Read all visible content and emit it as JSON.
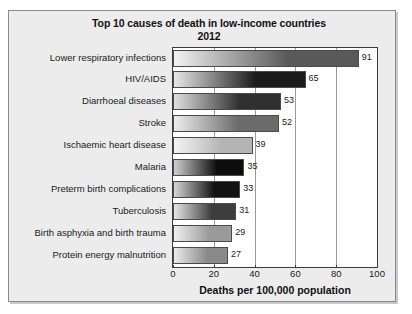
{
  "chart_data": {
    "type": "bar",
    "orientation": "horizontal",
    "title": "Top 10 causes of death in low-income countries",
    "subtitle": "2012",
    "xlabel": "Deaths per 100,000 population",
    "ylabel": "",
    "xlim": [
      0,
      100
    ],
    "xticks": [
      0,
      20,
      40,
      60,
      80,
      100
    ],
    "xtick_labels": [
      "0",
      "20",
      "40",
      "60",
      "80",
      "100"
    ],
    "grid": "vertical",
    "legend": "none",
    "categories": [
      "Lower respiratory infections",
      "HIV/AIDS",
      "Diarrhoeal diseases",
      "Stroke",
      "Ischaemic heart disease",
      "Malaria",
      "Preterm birth complications",
      "Tuberculosis",
      "Birth asphyxia and birth trauma",
      "Protein energy malnutrition"
    ],
    "values": [
      91,
      65,
      53,
      52,
      39,
      35,
      33,
      31,
      29,
      27
    ],
    "value_labels": [
      "91",
      "65",
      "53",
      "52",
      "39",
      "35",
      "33",
      "31",
      "29",
      "27"
    ],
    "bar_colors_dark": [
      "#595959",
      "#1c1c1c",
      "#303030",
      "#6b6b6b",
      "#b4b4b4",
      "#0d0d0d",
      "#121212",
      "#3d3d3d",
      "#9a9a9a",
      "#8a8a8a"
    ],
    "bar_colors_light": [
      "#f2f2f2",
      "#e8e8e8",
      "#e0e0e0",
      "#ededed",
      "#f4f4f4",
      "#cfcfcf",
      "#d6d6d6",
      "#e6e6e6",
      "#f0f0f0",
      "#ebebeb"
    ]
  },
  "colors": {
    "figure_background": "#ececec",
    "plot_background": "#ffffff",
    "axis": "#3b3b3b",
    "gridline": "#9a9a9a",
    "text": "#1a1a1a"
  }
}
